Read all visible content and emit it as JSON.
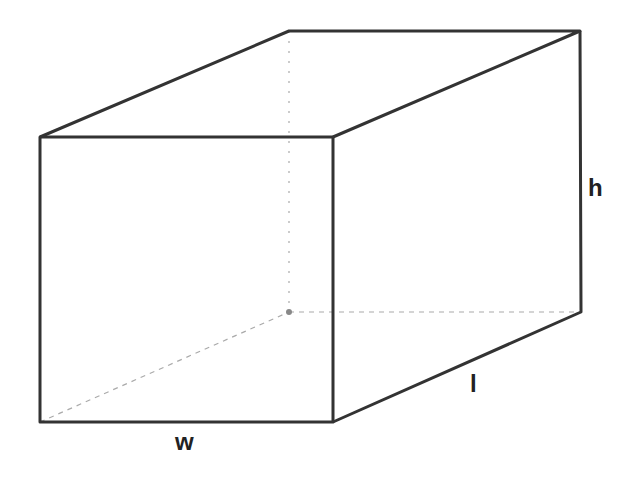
{
  "diagram": {
    "type": "rectangular-prism",
    "colors": {
      "solid_edge": "#333333",
      "hidden_edge": "#aaaaaa",
      "background": "#ffffff"
    },
    "vertices": {
      "front_top_left": [
        40,
        137
      ],
      "front_top_right": [
        333,
        137
      ],
      "front_bottom_left": [
        40,
        422
      ],
      "front_bottom_right": [
        333,
        422
      ],
      "back_top_left": [
        289,
        31
      ],
      "back_top_right": [
        580,
        31
      ],
      "back_bottom_left": [
        289,
        312
      ],
      "back_bottom_right": [
        581,
        312
      ]
    },
    "labels": {
      "width": "w",
      "length": "l",
      "height": "h"
    }
  }
}
